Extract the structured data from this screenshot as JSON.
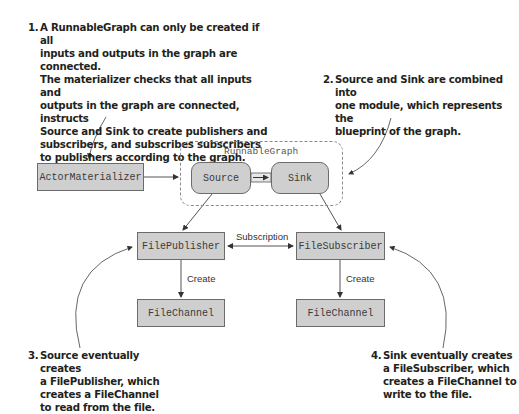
{
  "annotations": [
    {
      "number": "1.",
      "text": "A RunnableGraph can only be created if all\ninputs and outputs in the graph are connected.\nThe materializer checks that all inputs and\noutputs in the graph are connected, instructs\nSource and Sink to create publishers and\nsubscribers, and subscribes subscribers\nto publishers according to the graph."
    },
    {
      "number": "2.",
      "text": "Source and Sink are combined into\none module, which represents the\nblueprint of the graph."
    },
    {
      "number": "3.",
      "text": "Source eventually creates\na FilePublisher, which\ncreates a FileChannel\nto read from the file."
    },
    {
      "number": "4.",
      "text": "Sink eventually creates\na FileSubscriber, which\ncreates a FileChannel to\nwrite to the file."
    }
  ],
  "nodes": {
    "actor_materializer": "ActorMaterializer",
    "runnable_graph": "RunnableGraph",
    "source": "Source",
    "sink": "Sink",
    "file_publisher": "FilePublisher",
    "file_subscriber": "FileSubscriber",
    "file_channel_left": "FileChannel",
    "file_channel_right": "FileChannel"
  },
  "edges": {
    "subscription": "Subscription",
    "create_left": "Create",
    "create_right": "Create"
  },
  "colors": {
    "box_fill": "#cfcfcf",
    "box_border": "#6b6b6b",
    "text": "#231f20",
    "dashed_border": "#8a8a8a"
  }
}
